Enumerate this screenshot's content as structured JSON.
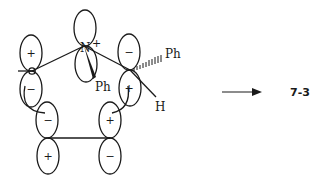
{
  "diagram": {
    "type": "orbital-overlap-reaction",
    "orbitals": [
      {
        "id": "c-left",
        "top_sign": "+",
        "bottom_sign": "−"
      },
      {
        "id": "n-top",
        "top_sign": "",
        "bottom_sign": "",
        "atom_label": "N",
        "charge": "+"
      },
      {
        "id": "c-right",
        "top_sign": "−",
        "bottom_sign": "+"
      },
      {
        "id": "c-bottom-left",
        "top_sign": "−",
        "bottom_sign": "+"
      },
      {
        "id": "c-bottom-right",
        "top_sign": "+",
        "bottom_sign": "−"
      }
    ],
    "substituents": {
      "n_ph": "Ph",
      "c_right_ph": "Ph",
      "c_right_h": "H"
    },
    "arrow": {
      "direction": "right"
    },
    "product_label": "7-3",
    "colors": {
      "ink": "#1a1a1a",
      "background": "#ffffff"
    }
  }
}
